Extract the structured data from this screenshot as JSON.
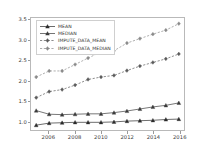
{
  "chart_data": {
    "type": "line",
    "title": "",
    "xlabel": "",
    "ylabel": "",
    "xlim": [
      2004.6,
      2016.4
    ],
    "ylim": [
      0.78,
      3.55
    ],
    "grid": false,
    "legend_position": "upper left",
    "x": [
      2005,
      2006,
      2007,
      2008,
      2009,
      2010,
      2011,
      2012,
      2013,
      2014,
      2015,
      2016
    ],
    "xticks": [
      2006,
      2008,
      2010,
      2012,
      2014,
      2016
    ],
    "xtick_labels": [
      "2006",
      "2008",
      "2010",
      "2012",
      "2014",
      "2016"
    ],
    "yticks": [
      1.0,
      1.5,
      2.0,
      2.5,
      3.0,
      3.5
    ],
    "ytick_labels": [
      "1.0",
      "1.5",
      "2.0",
      "2.5",
      "3.0",
      "3.5"
    ],
    "series": [
      {
        "name": "MEAN",
        "color": "#2b2b2b",
        "marker": "triangle",
        "linestyle": "solid",
        "values": [
          0.9,
          0.95,
          0.96,
          0.97,
          0.97,
          0.97,
          0.98,
          1.0,
          1.01,
          1.02,
          1.04,
          1.05
        ]
      },
      {
        "name": "MEDIAN",
        "color": "#3a3a3a",
        "marker": "triangle",
        "linestyle": "solid",
        "values": [
          1.26,
          1.17,
          1.16,
          1.17,
          1.18,
          1.18,
          1.21,
          1.25,
          1.3,
          1.35,
          1.39,
          1.45
        ]
      },
      {
        "name": "IMPUTE_DATA_MEAN",
        "color": "#5a5a5a",
        "marker": "diamond",
        "linestyle": "dashed",
        "values": [
          1.58,
          1.73,
          1.78,
          1.89,
          2.03,
          2.09,
          2.13,
          2.25,
          2.36,
          2.45,
          2.54,
          2.66
        ]
      },
      {
        "name": "IMPUTE_DATA_MEDIAN",
        "color": "#8a8a8a",
        "marker": "diamond",
        "linestyle": "dashed",
        "values": [
          2.09,
          2.24,
          2.24,
          2.4,
          2.56,
          2.71,
          2.74,
          2.93,
          3.04,
          3.15,
          3.25,
          3.41
        ]
      }
    ]
  }
}
